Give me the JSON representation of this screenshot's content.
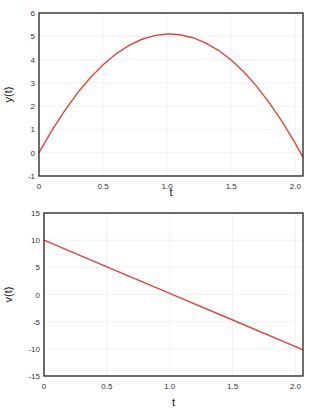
{
  "chart_data": [
    {
      "type": "line",
      "title": "",
      "xlabel": "t",
      "ylabel": "y(t)",
      "xlim": [
        0,
        2.06
      ],
      "ylim": [
        -1,
        6
      ],
      "xticks": [
        "0",
        "0.5",
        "1.0",
        "1.5",
        "2.0"
      ],
      "yticks": [
        "6",
        "5",
        "4",
        "3",
        "2",
        "1",
        "0",
        "-1"
      ],
      "grid": true,
      "line_color": "#e0453a",
      "series": [
        {
          "name": "y(t)",
          "x": [
            0,
            0.1,
            0.2,
            0.3,
            0.4,
            0.5,
            0.6,
            0.7,
            0.8,
            0.9,
            1.0,
            1.02,
            1.1,
            1.2,
            1.3,
            1.4,
            1.5,
            1.6,
            1.7,
            1.8,
            1.9,
            2.0,
            2.06
          ],
          "values": [
            0,
            0.95,
            1.8,
            2.56,
            3.22,
            3.78,
            4.24,
            4.6,
            4.86,
            5.03,
            5.1,
            5.1,
            5.07,
            4.94,
            4.72,
            4.4,
            3.98,
            3.46,
            2.84,
            2.12,
            1.31,
            0.4,
            -0.2
          ]
        }
      ]
    },
    {
      "type": "line",
      "title": "",
      "xlabel": "t",
      "ylabel": "v(t)",
      "xlim": [
        0,
        2.06
      ],
      "ylim": [
        -15,
        15
      ],
      "xticks": [
        "0",
        "0.5",
        "1.0",
        "1.5",
        "2.0"
      ],
      "yticks": [
        "15",
        "10",
        "5",
        "0",
        "-5",
        "-10",
        "-15"
      ],
      "grid": true,
      "line_color": "#e0453a",
      "series": [
        {
          "name": "v(t)",
          "x": [
            0,
            0.5,
            1.0,
            1.5,
            2.0,
            2.06
          ],
          "values": [
            10,
            5.1,
            0.2,
            -4.7,
            -9.6,
            -10.2
          ]
        }
      ]
    }
  ]
}
